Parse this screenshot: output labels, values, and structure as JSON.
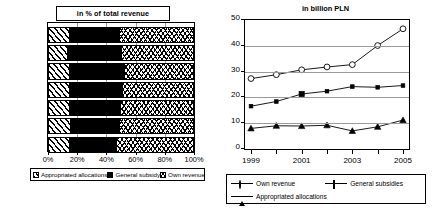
{
  "left_chart": {
    "title": "in % of total revenue",
    "axis": {
      "ticks": [
        "0%",
        "20%",
        "40%",
        "60%",
        "80%",
        "100%"
      ],
      "tick_values": [
        0,
        20,
        40,
        60,
        80,
        100
      ]
    },
    "legend": [
      {
        "label": "Appropriated allocations",
        "key": "alloc"
      },
      {
        "label": "General subsidy",
        "key": "subsidy"
      },
      {
        "label": "Own revenue",
        "key": "own"
      }
    ],
    "years": [
      "2005",
      "2004",
      "2003",
      "2002",
      "2001",
      "2000",
      "1999"
    ]
  },
  "right_chart": {
    "title": "in billion PLN",
    "axis": {
      "y_ticks": [
        "0",
        "10",
        "20",
        "30",
        "40",
        "50"
      ],
      "x_ticks": [
        "1999",
        "2001",
        "2003",
        "2005"
      ]
    },
    "legend": [
      {
        "label": "Own revenue",
        "marker": "circle"
      },
      {
        "label": "General subsidies",
        "marker": "square"
      },
      {
        "label": "Appropriated allocations",
        "marker": "triangle"
      }
    ]
  },
  "chart_data": [
    {
      "type": "bar",
      "orientation": "horizontal",
      "stacked": true,
      "stack_mode": "percent",
      "title": "in % of total revenue",
      "xlabel": "",
      "ylabel": "",
      "xlim": [
        0,
        100
      ],
      "xtick_labels": [
        "0%",
        "20%",
        "40%",
        "60%",
        "80%",
        "100%"
      ],
      "grid": true,
      "legend_position": "bottom",
      "categories": [
        "2005",
        "2004",
        "2003",
        "2002",
        "2001",
        "2000",
        "1999"
      ],
      "series": [
        {
          "name": "Appropriated allocations",
          "pattern": "diagonal-hatch",
          "values": [
            15.2,
            13.6,
            15.1,
            15.3,
            15.0,
            15.6,
            15.1
          ]
        },
        {
          "name": "General subsidy",
          "pattern": "solid-black",
          "values": [
            33.3,
            36.3,
            36.9,
            35.1,
            34.0,
            33.0,
            31.3
          ]
        },
        {
          "name": "Own revenue",
          "pattern": "cross-hatch",
          "values": [
            51.5,
            50.1,
            48.0,
            49.6,
            51.0,
            51.4,
            53.6
          ]
        }
      ]
    },
    {
      "type": "line",
      "title": "in billion PLN",
      "xlabel": "",
      "ylabel": "",
      "x": [
        1999,
        2000,
        2001,
        2002,
        2003,
        2004,
        2005
      ],
      "xtick_labels": [
        "1999",
        "2001",
        "2003",
        "2005"
      ],
      "ylim": [
        0,
        50
      ],
      "ytick_labels": [
        "0",
        "10",
        "20",
        "30",
        "40",
        "50"
      ],
      "grid": true,
      "legend_position": "bottom",
      "series": [
        {
          "name": "Own revenue",
          "marker": "circle-open",
          "values": [
            27.3,
            28.8,
            30.7,
            31.8,
            32.7,
            40.1,
            46.6
          ]
        },
        {
          "name": "General subsidies",
          "marker": "square-filled",
          "values": [
            16.6,
            18.4,
            21.3,
            22.4,
            24.2,
            23.9,
            24.6
          ]
        },
        {
          "name": "Appropriated allocations",
          "marker": "triangle-filled",
          "values": [
            8.0,
            9.0,
            8.9,
            9.2,
            7.0,
            8.6,
            11.2
          ]
        }
      ]
    }
  ]
}
